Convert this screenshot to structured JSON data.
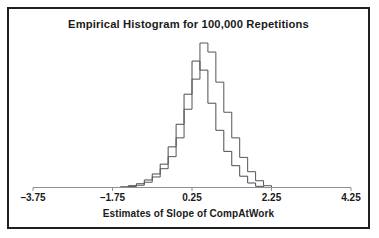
{
  "figure": {
    "title": "Empirical Histogram for 100,000 Repetitions",
    "xlabel": "Estimates of Slope of CompAtWork",
    "border_color": "#231f20",
    "background_color": "#ffffff"
  },
  "chart_data": {
    "type": "bar",
    "subtype": "step-histogram-outline",
    "title": "Empirical Histogram for 100,000 Repetitions",
    "xlabel": "Estimates of Slope of CompAtWork",
    "ylabel": "",
    "grid": false,
    "legend": "none",
    "xlim": [
      -3.75,
      4.25
    ],
    "xticks": [
      -3.75,
      -1.75,
      0.25,
      2.25,
      4.25
    ],
    "xticklabels": [
      "-3.75",
      "-1.75",
      "0.25",
      "2.25",
      "4.25"
    ],
    "ylim": [
      0,
      1.0
    ],
    "bin_width": 0.2,
    "series": [
      {
        "name": "histogram-a",
        "color": "#4b4b52",
        "bin_left_edges": [
          -1.55,
          -1.35,
          -1.15,
          -0.95,
          -0.75,
          -0.55,
          -0.35,
          -0.15,
          0.05,
          0.25,
          0.45,
          0.65,
          0.85,
          1.05,
          1.25,
          1.45,
          1.65,
          1.85
        ],
        "values": [
          0.005,
          0.012,
          0.025,
          0.05,
          0.09,
          0.155,
          0.27,
          0.42,
          0.62,
          0.84,
          0.78,
          0.56,
          0.38,
          0.24,
          0.145,
          0.075,
          0.03,
          0.008
        ]
      },
      {
        "name": "histogram-b",
        "color": "#55555c",
        "bin_left_edges": [
          -1.35,
          -1.15,
          -0.95,
          -0.75,
          -0.55,
          -0.35,
          -0.15,
          0.05,
          0.25,
          0.45,
          0.65,
          0.85,
          1.05,
          1.25,
          1.45,
          1.65,
          1.85,
          2.05
        ],
        "values": [
          0.006,
          0.015,
          0.035,
          0.07,
          0.125,
          0.205,
          0.33,
          0.52,
          0.72,
          0.96,
          0.9,
          0.7,
          0.5,
          0.33,
          0.2,
          0.105,
          0.045,
          0.012
        ]
      }
    ]
  },
  "axis": {
    "ticks": [
      {
        "value": -3.75,
        "label": "-3.75"
      },
      {
        "value": -1.75,
        "label": "-1.75"
      },
      {
        "value": 0.25,
        "label": "0.25"
      },
      {
        "value": 2.25,
        "label": "2.25"
      },
      {
        "value": 4.25,
        "label": "4.25"
      }
    ]
  }
}
